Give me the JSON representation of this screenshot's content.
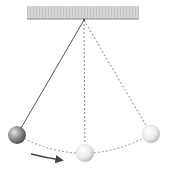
{
  "diagram": {
    "ceiling": {
      "x": 27,
      "y": 6,
      "width": 112,
      "height": 13,
      "fill": "#d4d4d4",
      "edge": "#8a8a8a"
    },
    "pivot": {
      "x": 84,
      "y": 20
    },
    "positions": [
      {
        "name": "left-extreme",
        "x": 17,
        "y": 135,
        "r": 9,
        "string": "solid",
        "shade": "dark"
      },
      {
        "name": "bottom-center",
        "x": 85,
        "y": 153,
        "r": 9,
        "string": "dashed",
        "shade": "light"
      },
      {
        "name": "right-extreme",
        "x": 151,
        "y": 134,
        "r": 9,
        "string": "dashed",
        "shade": "light"
      }
    ],
    "arc_path": "M 17 135 Q 85 172 151 134",
    "motion_arrow": {
      "path": "M 31 154 Q 47 158 61 160",
      "direction": "right"
    },
    "colors": {
      "string_solid": "#555555",
      "string_dashed": "#777777",
      "arc": "#888888",
      "arrow": "#444444"
    }
  }
}
